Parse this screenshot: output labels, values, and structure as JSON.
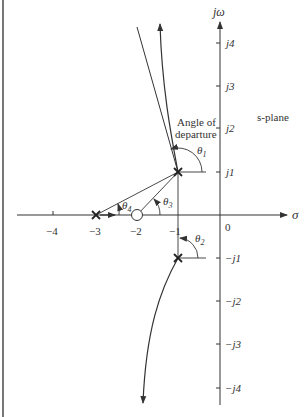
{
  "axes": {
    "imag_label": "jω",
    "real_label": "σ",
    "origin_label": "0",
    "real_ticks": [
      "−4",
      "−3",
      "−2",
      "−1"
    ],
    "imag_ticks_pos": [
      "j1",
      "j2",
      "j3",
      "j4"
    ],
    "imag_ticks_neg": [
      "−j1",
      "−j2",
      "−j3",
      "−j4"
    ]
  },
  "annotations": {
    "plane_label": "s-plane",
    "departure_line1": "Angle of",
    "departure_line2": "departure",
    "theta1": "θ",
    "theta1_sub": "1",
    "theta2": "θ",
    "theta2_sub": "2",
    "theta3": "θ",
    "theta3_sub": "3",
    "theta4": "θ",
    "theta4_sub": "4"
  },
  "poles": [
    {
      "re": -3,
      "im": 0
    },
    {
      "re": -1,
      "im": 1
    },
    {
      "re": -1,
      "im": -1
    }
  ],
  "zeros": [
    {
      "re": -2,
      "im": 0
    }
  ],
  "colors": {
    "line": "#333333",
    "border": "#777777",
    "background": "#ffffff"
  }
}
